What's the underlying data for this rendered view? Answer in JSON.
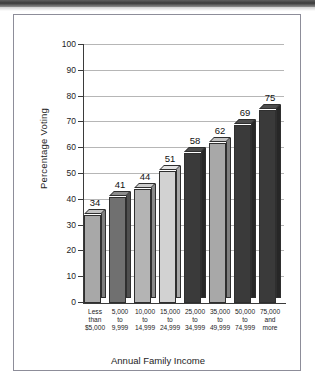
{
  "figure": {
    "y_axis_title": "Percentage Voting",
    "x_axis_title": "Annual Family Income"
  },
  "chart_data": {
    "type": "bar",
    "title": "",
    "xlabel": "Annual Family Income",
    "ylabel": "Percentage Voting",
    "ylim": [
      0,
      100
    ],
    "yticks": [
      0,
      10,
      20,
      30,
      40,
      50,
      60,
      70,
      80,
      90,
      100
    ],
    "ytick_labels": [
      "0",
      "10",
      "20",
      "30",
      "40",
      "50",
      "60",
      "70",
      "80",
      "90",
      "100"
    ],
    "grid": true,
    "legend": "none",
    "style": "3d-extruded-bars",
    "categories": [
      "Less than $5,000",
      "5,000 to 9,999",
      "10,000 to 14,999",
      "15,000 to 24,999",
      "25,000 to 34,999",
      "35,000 to 49,999",
      "50,000 to 74,999",
      "75,000 and more"
    ],
    "category_lines": [
      [
        "Less",
        "than",
        "$5,000"
      ],
      [
        "5,000",
        "to",
        "9,999"
      ],
      [
        "10,000",
        "to",
        "14,999"
      ],
      [
        "15,000",
        "to",
        "24,999"
      ],
      [
        "25,000",
        "to",
        "34,999"
      ],
      [
        "35,000",
        "to",
        "49,999"
      ],
      [
        "50,000",
        "to",
        "74,999"
      ],
      [
        "75,000",
        "and",
        "more"
      ]
    ],
    "values": [
      34,
      41,
      44,
      51,
      58,
      62,
      69,
      75
    ],
    "value_labels": [
      "34",
      "41",
      "44",
      "51",
      "58",
      "62",
      "69",
      "75"
    ],
    "bar_colors": [
      "#a8a8a8",
      "#707070",
      "#b4b4b4",
      "#d2d2d2",
      "#3a3a3a",
      "#a8a8a8",
      "#3a3a3a",
      "#3a3a3a"
    ],
    "bar_side_colors": [
      "#7e7e7e",
      "#4f4f4f",
      "#8a8a8a",
      "#a6a6a6",
      "#272727",
      "#7e7e7e",
      "#272727",
      "#272727"
    ],
    "bar_top_colors": [
      "#c2c2c2",
      "#8c8c8c",
      "#cccccc",
      "#e2e2e2",
      "#4e4e4e",
      "#c2c2c2",
      "#4e4e4e",
      "#4e4e4e"
    ]
  },
  "colors": {
    "grid": "#b6b6b6",
    "axis": "#3b3b3b",
    "frame": "#8d8d99",
    "text": "#1d1d1d",
    "background": "#ffffff"
  }
}
